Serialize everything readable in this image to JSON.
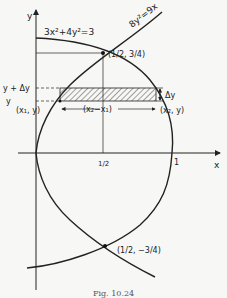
{
  "figure": {
    "caption": "Fig. 10.24",
    "axes": {
      "x_label": "x",
      "y_label": "y",
      "x_ticks": [
        {
          "value": 0.5,
          "label": "1/2"
        },
        {
          "value": 1,
          "label": "1"
        }
      ]
    },
    "curves": [
      {
        "name": "ellipse",
        "equation": "3x²+4y²=3"
      },
      {
        "name": "parabola",
        "equation": "8y²=9x"
      }
    ],
    "points": [
      {
        "label": "(1/2, 3/4)",
        "x": 0.5,
        "y": 0.75
      },
      {
        "label": "(1/2, −3/4)",
        "x": 0.5,
        "y": -0.75
      }
    ],
    "strip": {
      "left_point": "(x₁, y)",
      "right_point": "(x₂, y)",
      "width_label": "(x₂−x₁)",
      "height_label": "Δy",
      "y_label": "y",
      "y_plus_label": "y + Δy"
    },
    "colors": {
      "ink": "#222222",
      "background": "#f7f7f5"
    }
  }
}
